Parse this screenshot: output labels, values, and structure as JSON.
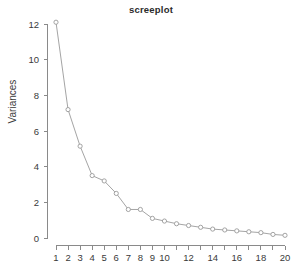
{
  "chart_data": {
    "type": "line",
    "title": "screeplot",
    "xlabel": "",
    "ylabel": "Variances",
    "x": [
      1,
      2,
      3,
      4,
      5,
      6,
      7,
      8,
      9,
      10,
      11,
      12,
      13,
      14,
      15,
      16,
      17,
      18,
      19,
      20
    ],
    "values": [
      12.1,
      7.2,
      5.15,
      3.5,
      3.2,
      2.5,
      1.6,
      1.6,
      1.1,
      0.95,
      0.8,
      0.7,
      0.6,
      0.5,
      0.45,
      0.4,
      0.35,
      0.3,
      0.2,
      0.15
    ],
    "series": [
      {
        "name": "Variances",
        "values": [
          12.1,
          7.2,
          5.15,
          3.5,
          3.2,
          2.5,
          1.6,
          1.6,
          1.1,
          0.95,
          0.8,
          0.7,
          0.6,
          0.5,
          0.45,
          0.4,
          0.35,
          0.3,
          0.2,
          0.15
        ]
      }
    ],
    "xlim": [
      1,
      20
    ],
    "ylim": [
      0,
      12
    ],
    "y_ticks": [
      0,
      2,
      4,
      6,
      8,
      10,
      12
    ],
    "y_tick_labels": [
      "0",
      "2",
      "4",
      "6",
      "8",
      "10",
      "12"
    ],
    "x_ticks": [
      1,
      2,
      3,
      4,
      5,
      6,
      7,
      8,
      9,
      10,
      11,
      12,
      13,
      14,
      15,
      16,
      17,
      18,
      19,
      20
    ],
    "x_tick_labels": [
      "1",
      "2",
      "3",
      "4",
      "5",
      "6",
      "7",
      "8",
      "9",
      "10",
      "",
      "12",
      "",
      "14",
      "",
      "16",
      "",
      "18",
      "",
      "20"
    ],
    "grid": false,
    "legend": false,
    "marker": "open-circle",
    "line_style": "solid",
    "colors": {
      "line": "#9a9a9a",
      "marker": "#9a9a9a",
      "axis": "#8a8a8a",
      "text": "#3a3a3a",
      "title": "#2b2b2b",
      "background": "#ffffff"
    }
  }
}
